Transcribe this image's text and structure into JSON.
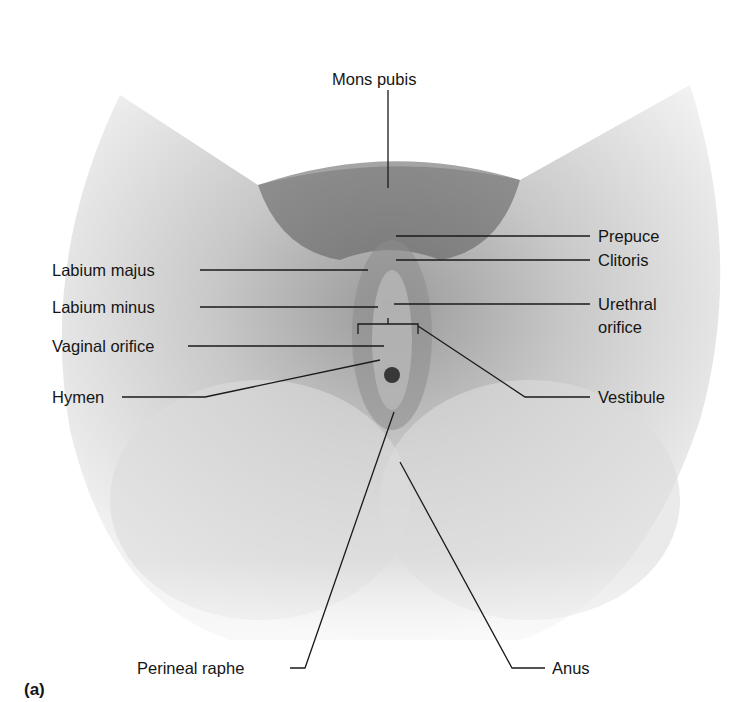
{
  "figure": {
    "panel_label": "(a)"
  },
  "labels": {
    "mons_pubis": "Mons pubis",
    "prepuce": "Prepuce",
    "clitoris": "Clitoris",
    "labium_majus": "Labium majus",
    "labium_minus": "Labium minus",
    "urethral_orifice_line1": "Urethral",
    "urethral_orifice_line2": "orifice",
    "vaginal_orifice": "Vaginal orifice",
    "hymen": "Hymen",
    "vestibule": "Vestibule",
    "perineal_raphe": "Perineal raphe",
    "anus": "Anus"
  },
  "colors": {
    "background": "#ffffff",
    "leader_line": "#1a1a1a",
    "shading_dark": "#6e6e6e",
    "shading_light": "#e6e6e6"
  }
}
